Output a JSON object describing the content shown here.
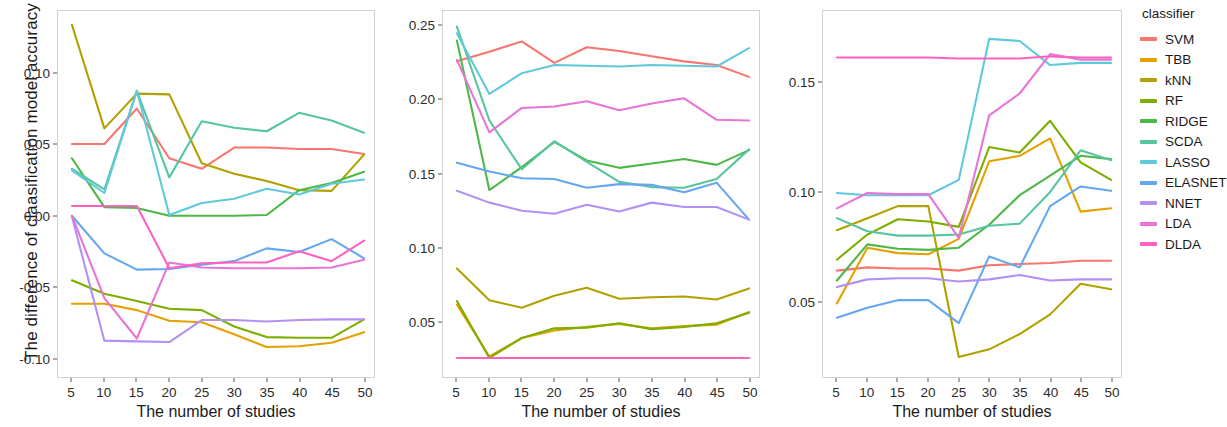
{
  "legend": {
    "title": "classifier",
    "items": [
      {
        "label": "SVM",
        "color": "#F8766D"
      },
      {
        "label": "TBB",
        "color": "#E5A000"
      },
      {
        "label": "kNN",
        "color": "#B2A000"
      },
      {
        "label": "RF",
        "color": "#7CAE00"
      },
      {
        "label": "RIDGE",
        "color": "#4DB848"
      },
      {
        "label": "SCDA",
        "color": "#56C5A0"
      },
      {
        "label": "LASSO",
        "color": "#5FC9DC"
      },
      {
        "label": "ELASNET",
        "color": "#63A7F0"
      },
      {
        "label": "NNET",
        "color": "#B390F4"
      },
      {
        "label": "LDA",
        "color": "#E874D6"
      },
      {
        "label": "DLDA",
        "color": "#FF61C3"
      }
    ]
  },
  "axis": {
    "ylabel": "The difference of claasification model accuracy",
    "xlabel": "The number of studies"
  },
  "chart_data": [
    {
      "type": "line",
      "panel": 1,
      "title": "",
      "xlabel": "The number of studies",
      "ylabel": "The difference of claasification model accuracy",
      "x": [
        5,
        10,
        15,
        20,
        25,
        30,
        35,
        40,
        45,
        50
      ],
      "xticks": [
        5,
        10,
        15,
        20,
        25,
        30,
        35,
        40,
        45,
        50
      ],
      "yticks": [
        -0.1,
        -0.05,
        0.0,
        0.05,
        0.1
      ],
      "ytick_labels": [
        "-0.10",
        "-0.05",
        "0.00",
        "0.05",
        "0.10"
      ],
      "xlim": [
        5,
        50
      ],
      "ylim": [
        -0.108,
        0.14
      ],
      "grid": false,
      "legend_position": "right",
      "series": [
        {
          "name": "SVM",
          "color": "#F8766D",
          "values": [
            0.0505,
            0.0505,
            0.0755,
            0.0405,
            0.033,
            0.048,
            0.048,
            0.047,
            0.047,
            0.0435
          ]
        },
        {
          "name": "TBB",
          "color": "#E5A000",
          "values": [
            -0.062,
            -0.062,
            -0.0665,
            -0.074,
            -0.075,
            -0.0835,
            -0.0925,
            -0.092,
            -0.0895,
            -0.082
          ]
        },
        {
          "name": "kNN",
          "color": "#B2A000",
          "values": [
            0.1345,
            0.0615,
            0.086,
            0.0855,
            0.037,
            0.0295,
            0.0245,
            0.018,
            0.0175,
            0.043
          ]
        },
        {
          "name": "RF",
          "color": "#7CAE00",
          "values": [
            -0.0455,
            -0.055,
            -0.06,
            -0.0655,
            -0.0665,
            -0.078,
            -0.0855,
            -0.086,
            -0.086,
            -0.073
          ]
        },
        {
          "name": "RIDGE",
          "color": "#4DB848",
          "values": [
            0.0405,
            0.006,
            0.0055,
            0.0,
            0.0,
            0.0,
            0.0005,
            0.018,
            0.023,
            0.031
          ]
        },
        {
          "name": "SCDA",
          "color": "#56C5A0",
          "values": [
            0.033,
            0.0185,
            0.088,
            0.027,
            0.0665,
            0.062,
            0.0595,
            0.0725,
            0.067,
            0.0585
          ]
        },
        {
          "name": "LASSO",
          "color": "#5FC9DC",
          "values": [
            0.032,
            0.016,
            0.088,
            0.0005,
            0.009,
            0.012,
            0.019,
            0.015,
            0.0225,
            0.0255
          ]
        },
        {
          "name": "ELASNET",
          "color": "#63A7F0",
          "values": [
            0.0,
            -0.0265,
            -0.038,
            -0.0375,
            -0.0345,
            -0.032,
            -0.023,
            -0.0255,
            -0.0165,
            -0.03
          ]
        },
        {
          "name": "NNET",
          "color": "#B390F4",
          "values": [
            -0.0005,
            -0.088,
            -0.0885,
            -0.089,
            -0.0735,
            -0.0735,
            -0.0745,
            -0.0735,
            -0.073,
            -0.073
          ]
        },
        {
          "name": "LDA",
          "color": "#E874D6",
          "values": [
            0.0,
            -0.058,
            -0.0865,
            -0.033,
            -0.0365,
            -0.037,
            -0.037,
            -0.037,
            -0.0365,
            -0.031
          ]
        },
        {
          "name": "DLDA",
          "color": "#FF61C3",
          "values": [
            0.0068,
            0.0068,
            0.0068,
            -0.037,
            -0.0335,
            -0.033,
            -0.033,
            -0.025,
            -0.032,
            -0.0175
          ]
        }
      ]
    },
    {
      "type": "line",
      "panel": 2,
      "title": "",
      "xlabel": "The number of studies",
      "ylabel": "",
      "x": [
        5,
        10,
        15,
        20,
        25,
        30,
        35,
        40,
        45,
        50
      ],
      "xticks": [
        5,
        10,
        15,
        20,
        25,
        30,
        35,
        40,
        45,
        50
      ],
      "yticks": [
        0.05,
        0.1,
        0.15,
        0.2,
        0.25
      ],
      "ytick_labels": [
        "0.05",
        "0.10",
        "0.15",
        "0.20",
        "0.25"
      ],
      "xlim": [
        5,
        50
      ],
      "ylim": [
        0.018,
        0.256
      ],
      "grid": false,
      "legend_position": "right",
      "series": [
        {
          "name": "SVM",
          "color": "#F8766D",
          "values": [
            0.226,
            0.2325,
            0.2395,
            0.225,
            0.2355,
            0.233,
            0.2295,
            0.226,
            0.2235,
            0.2155
          ]
        },
        {
          "name": "TBB",
          "color": "#E5A000",
          "values": [
            0.0615,
            0.0265,
            0.039,
            0.044,
            0.0465,
            0.0485,
            0.0455,
            0.047,
            0.048,
            0.0565
          ]
        },
        {
          "name": "kNN",
          "color": "#B2A000",
          "values": [
            0.086,
            0.0645,
            0.0595,
            0.0675,
            0.073,
            0.0655,
            0.0665,
            0.067,
            0.065,
            0.0725
          ]
        },
        {
          "name": "RF",
          "color": "#7CAE00",
          "values": [
            0.064,
            0.0255,
            0.039,
            0.0455,
            0.046,
            0.049,
            0.045,
            0.0465,
            0.049,
            0.056
          ]
        },
        {
          "name": "RIDGE",
          "color": "#4DB848",
          "values": [
            0.24,
            0.139,
            0.1545,
            0.1715,
            0.159,
            0.154,
            0.157,
            0.16,
            0.156,
            0.166
          ]
        },
        {
          "name": "SCDA",
          "color": "#56C5A0",
          "values": [
            0.2495,
            0.186,
            0.153,
            0.172,
            0.158,
            0.1445,
            0.141,
            0.1405,
            0.1465,
            0.1665
          ]
        },
        {
          "name": "LASSO",
          "color": "#5FC9DC",
          "values": [
            0.245,
            0.204,
            0.218,
            0.2235,
            0.223,
            0.2225,
            0.2235,
            0.223,
            0.2225,
            0.235
          ]
        },
        {
          "name": "ELASNET",
          "color": "#63A7F0",
          "values": [
            0.1575,
            0.1515,
            0.147,
            0.1465,
            0.1405,
            0.143,
            0.1425,
            0.1375,
            0.144,
            0.119
          ]
        },
        {
          "name": "NNET",
          "color": "#B390F4",
          "values": [
            0.1385,
            0.1305,
            0.125,
            0.123,
            0.129,
            0.1245,
            0.1305,
            0.1275,
            0.1275,
            0.119
          ]
        },
        {
          "name": "LDA",
          "color": "#E874D6",
          "values": [
            0.227,
            0.178,
            0.1945,
            0.1955,
            0.199,
            0.193,
            0.1975,
            0.201,
            0.1865,
            0.186
          ]
        },
        {
          "name": "DLDA",
          "color": "#FF61C3",
          "values": [
            0.0255,
            0.0255,
            0.0255,
            0.0255,
            0.0255,
            0.0255,
            0.0255,
            0.0255,
            0.0255,
            0.0255
          ]
        }
      ]
    },
    {
      "type": "line",
      "panel": 3,
      "title": "",
      "xlabel": "The number of studies",
      "ylabel": "",
      "x": [
        5,
        10,
        15,
        20,
        25,
        30,
        35,
        40,
        45,
        50
      ],
      "xticks": [
        5,
        10,
        15,
        20,
        25,
        30,
        35,
        40,
        45,
        50
      ],
      "yticks": [
        0.05,
        0.1,
        0.15
      ],
      "ytick_labels": [
        "0.05",
        "0.10",
        "0.15"
      ],
      "xlim": [
        5,
        50
      ],
      "ylim": [
        0.019,
        0.18
      ],
      "grid": false,
      "legend_position": "right",
      "series": [
        {
          "name": "SVM",
          "color": "#F8766D",
          "values": [
            0.064,
            0.0655,
            0.065,
            0.065,
            0.064,
            0.0665,
            0.067,
            0.0675,
            0.0685,
            0.0685
          ]
        },
        {
          "name": "TBB",
          "color": "#E5A000",
          "values": [
            0.049,
            0.0745,
            0.072,
            0.0715,
            0.0785,
            0.114,
            0.1165,
            0.1245,
            0.091,
            0.0925
          ]
        },
        {
          "name": "kNN",
          "color": "#B2A000",
          "values": [
            0.0825,
            0.088,
            0.0935,
            0.0935,
            0.0245,
            0.028,
            0.035,
            0.044,
            0.058,
            0.0555
          ]
        },
        {
          "name": "RF",
          "color": "#7CAE00",
          "values": [
            0.069,
            0.0805,
            0.0875,
            0.0865,
            0.084,
            0.1205,
            0.118,
            0.1325,
            0.1135,
            0.1055
          ]
        },
        {
          "name": "RIDGE",
          "color": "#4DB848",
          "values": [
            0.0595,
            0.076,
            0.074,
            0.0735,
            0.0745,
            0.085,
            0.0985,
            0.1075,
            0.1165,
            0.115
          ]
        },
        {
          "name": "SCDA",
          "color": "#56C5A0",
          "values": [
            0.088,
            0.082,
            0.08,
            0.08,
            0.0805,
            0.0845,
            0.0855,
            0.1,
            0.119,
            0.1145
          ]
        },
        {
          "name": "LASSO",
          "color": "#5FC9DC",
          "values": [
            0.0995,
            0.0985,
            0.0985,
            0.0985,
            0.1055,
            0.17,
            0.169,
            0.158,
            0.159,
            0.159
          ]
        },
        {
          "name": "ELASNET",
          "color": "#63A7F0",
          "values": [
            0.0425,
            0.047,
            0.0505,
            0.0505,
            0.04,
            0.0705,
            0.0655,
            0.0935,
            0.1025,
            0.1005
          ]
        },
        {
          "name": "NNET",
          "color": "#B390F4",
          "values": [
            0.0565,
            0.06,
            0.0605,
            0.0605,
            0.059,
            0.06,
            0.062,
            0.0595,
            0.06,
            0.06
          ]
        },
        {
          "name": "LDA",
          "color": "#E874D6",
          "values": [
            0.0925,
            0.0995,
            0.099,
            0.099,
            0.079,
            0.135,
            0.145,
            0.163,
            0.1605,
            0.1605
          ]
        },
        {
          "name": "DLDA",
          "color": "#FF61C3",
          "values": [
            0.1615,
            0.1615,
            0.1615,
            0.1615,
            0.161,
            0.161,
            0.161,
            0.162,
            0.1615,
            0.1615
          ]
        }
      ]
    }
  ]
}
